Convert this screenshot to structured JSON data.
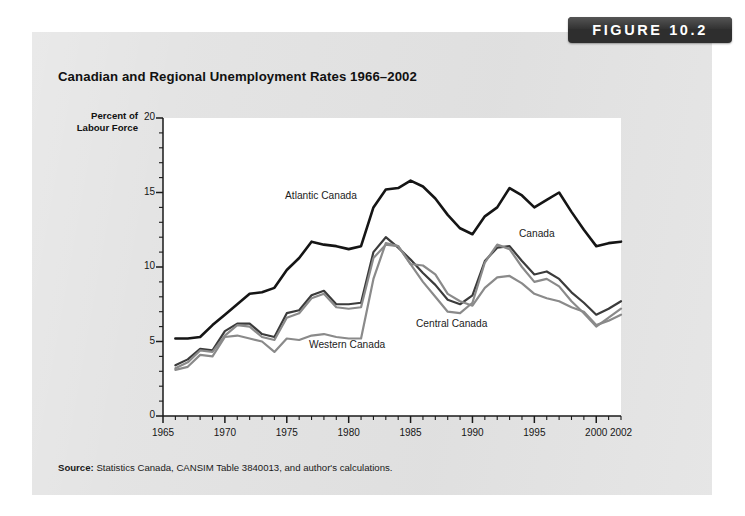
{
  "figure": {
    "badge_label": "FIGURE 10.2",
    "title": "Canadian and Regional Unemployment Rates 1966–2002",
    "source_prefix": "Source:",
    "source_text": " Statistics Canada, CANSIM Table 3840013, and author's calculations.",
    "panel_color": "#e3e3e3",
    "badge_color": "#2e2e2e",
    "plot_background": "#ffffff"
  },
  "axes": {
    "ylabel_line1": "Percent of",
    "ylabel_line2": "Labour Force",
    "y_ticks": [
      "0",
      "5",
      "10",
      "15",
      "20"
    ],
    "x_ticks": [
      "1965",
      "1970",
      "1975",
      "1980",
      "1985",
      "1990",
      "1995",
      "2000",
      "2002"
    ]
  },
  "annotations": [
    {
      "name": "atlantic-canada-label",
      "text": "Atlantic Canada",
      "x": 285,
      "y": 190
    },
    {
      "name": "canada-label",
      "text": "Canada",
      "x": 519,
      "y": 228
    },
    {
      "name": "central-canada-label",
      "text": "Central Canada",
      "x": 416,
      "y": 318
    },
    {
      "name": "western-canada-label",
      "text": "Western Canada",
      "x": 309,
      "y": 339
    }
  ],
  "chart_data": {
    "type": "line",
    "title": "Canadian and Regional Unemployment Rates 1966–2002",
    "xlabel": "",
    "ylabel": "Percent of Labour Force",
    "xlim": [
      1965,
      2002
    ],
    "ylim": [
      0,
      20
    ],
    "y_major_step": 5,
    "y_minor_step": 1,
    "x_major_step": 5,
    "x_minor_step": 1,
    "grid": false,
    "legend": "inline-annotations",
    "x": [
      1966,
      1967,
      1968,
      1969,
      1970,
      1971,
      1972,
      1973,
      1974,
      1975,
      1976,
      1977,
      1978,
      1979,
      1980,
      1981,
      1982,
      1983,
      1984,
      1985,
      1986,
      1987,
      1988,
      1989,
      1990,
      1991,
      1992,
      1993,
      1994,
      1995,
      1996,
      1997,
      1998,
      1999,
      2000,
      2001,
      2002
    ],
    "series": [
      {
        "name": "Atlantic Canada",
        "color": "#151515",
        "width": 2.6,
        "values": [
          5.2,
          5.2,
          5.3,
          6.1,
          6.8,
          7.5,
          8.2,
          8.3,
          8.6,
          9.8,
          10.6,
          11.7,
          11.5,
          11.4,
          11.2,
          11.4,
          14.0,
          15.2,
          15.3,
          15.8,
          15.4,
          14.6,
          13.5,
          12.6,
          12.2,
          13.4,
          14.0,
          15.3,
          14.8,
          14.0,
          14.5,
          15.0,
          13.7,
          12.5,
          11.4,
          11.6,
          11.7
        ]
      },
      {
        "name": "Canada",
        "color": "#3b3b3b",
        "width": 2.2,
        "values": [
          3.4,
          3.8,
          4.5,
          4.4,
          5.7,
          6.2,
          6.2,
          5.5,
          5.3,
          6.9,
          7.1,
          8.1,
          8.4,
          7.5,
          7.5,
          7.6,
          11.0,
          12.0,
          11.3,
          10.5,
          9.6,
          8.8,
          7.8,
          7.5,
          8.1,
          10.4,
          11.3,
          11.4,
          10.4,
          9.5,
          9.7,
          9.2,
          8.3,
          7.6,
          6.8,
          7.2,
          7.7
        ]
      },
      {
        "name": "Central Canada",
        "color": "#8a8a8a",
        "width": 2.2,
        "values": [
          3.2,
          3.6,
          4.4,
          4.3,
          5.4,
          6.1,
          6.0,
          5.3,
          5.1,
          6.6,
          6.9,
          7.9,
          8.2,
          7.3,
          7.2,
          7.3,
          10.6,
          11.5,
          11.4,
          10.2,
          9.0,
          8.0,
          7.0,
          6.9,
          7.6,
          10.3,
          11.5,
          11.2,
          10.0,
          9.0,
          9.2,
          8.7,
          7.7,
          6.9,
          6.0,
          6.6,
          7.2
        ]
      },
      {
        "name": "Western Canada",
        "color": "#8a8a8a",
        "width": 2.2,
        "values": [
          3.1,
          3.3,
          4.1,
          4.0,
          5.3,
          5.4,
          5.2,
          5.0,
          4.3,
          5.2,
          5.1,
          5.4,
          5.5,
          5.3,
          5.2,
          5.2,
          9.2,
          11.6,
          11.4,
          10.2,
          10.1,
          9.5,
          8.2,
          7.7,
          7.4,
          8.6,
          9.3,
          9.4,
          8.9,
          8.2,
          7.9,
          7.7,
          7.3,
          7.0,
          6.1,
          6.4,
          6.8
        ]
      }
    ]
  },
  "plot_geometry": {
    "left": 163,
    "right": 621,
    "top": 118,
    "bottom": 416
  }
}
